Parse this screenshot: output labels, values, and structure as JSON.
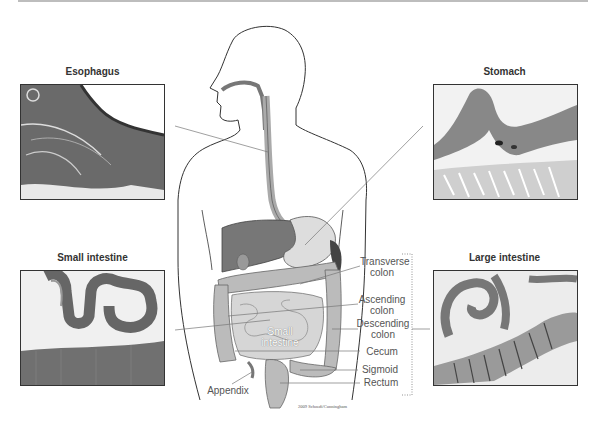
{
  "figure": {
    "panels": [
      {
        "id": "esophagus",
        "title": "Esophagus"
      },
      {
        "id": "stomach",
        "title": "Stomach"
      },
      {
        "id": "small-intestine",
        "title": "Small intestine"
      },
      {
        "id": "large-intestine",
        "title": "Large intestine"
      }
    ],
    "labels": {
      "transverse_colon": "Transverse\ncolon",
      "ascending_colon": "Ascending\ncolon",
      "descending_colon": "Descending\ncolon",
      "cecum": "Cecum",
      "sigmoid": "Sigmoid",
      "rectum": "Rectum",
      "appendix": "Appendix",
      "small_intestine": "Small\nintestine"
    },
    "credit": "2009 Schoedi/Cunningham"
  }
}
